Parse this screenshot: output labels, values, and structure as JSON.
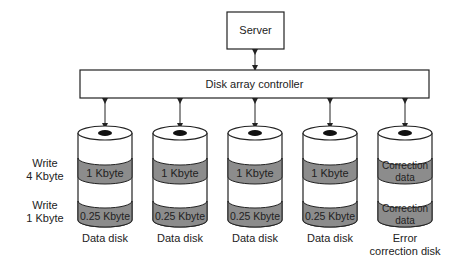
{
  "server": {
    "label": "Server"
  },
  "controller": {
    "label": "Disk array controller"
  },
  "row_labels": [
    {
      "line1": "Write",
      "line2": "4 Kbyte"
    },
    {
      "line1": "Write",
      "line2": "1 Kbyte"
    }
  ],
  "disks": [
    {
      "band1": "1 Kbyte",
      "band2": "0.25 Kbyte",
      "caption1": "Data disk",
      "caption2": ""
    },
    {
      "band1": "1 Kbyte",
      "band2": "0.25 Kbyte",
      "caption1": "Data disk",
      "caption2": ""
    },
    {
      "band1": "1 Kbyte",
      "band2": "0.25 Kbyte",
      "caption1": "Data disk",
      "caption2": ""
    },
    {
      "band1": "1 Kbyte",
      "band2": "0.25 Kbyte",
      "caption1": "Data disk",
      "caption2": ""
    },
    {
      "band1a": "Correction",
      "band1b": "data",
      "band2a": "Correction",
      "band2b": "data",
      "caption1": "Error",
      "caption2": "correction disk"
    }
  ],
  "colors": {
    "band": "#8c8c8c",
    "stroke": "#222222",
    "hub": "#111111"
  }
}
